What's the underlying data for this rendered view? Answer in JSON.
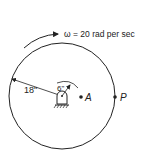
{
  "diagram": {
    "omega_label": "ω = 20 rad per sec",
    "outer_radius_label": "18\"",
    "inner_radius_label": "6\"",
    "point_a_label": "A",
    "point_p_label": "P",
    "stroke_color": "#222222"
  }
}
